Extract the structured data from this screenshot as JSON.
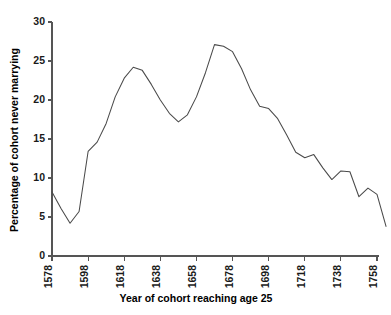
{
  "chart_data": {
    "type": "line",
    "title": "",
    "subtitle": "",
    "xlabel": "Year of cohort reaching age 25",
    "ylabel": "Percentage of cohort never marrying",
    "xlim": [
      1578,
      1758
    ],
    "ylim": [
      0,
      30
    ],
    "grid": false,
    "legend": null,
    "legend_position": "none",
    "xticks": [
      1578,
      1598,
      1618,
      1638,
      1658,
      1678,
      1698,
      1718,
      1738,
      1758
    ],
    "xtick_labels": [
      "1578",
      "1598",
      "1618",
      "1638",
      "1658",
      "1678",
      "1698",
      "1718",
      "1738",
      "1758"
    ],
    "xtick_rotation": 90,
    "yticks": [
      0,
      5,
      10,
      15,
      20,
      25,
      30
    ],
    "ytick_labels": [
      "0",
      "5",
      "10",
      "15",
      "20",
      "25",
      "30"
    ],
    "line_color": "#4a4a4a",
    "axis_color": "#555555",
    "x": [
      1578,
      1583,
      1588,
      1593,
      1598,
      1603,
      1608,
      1613,
      1618,
      1623,
      1628,
      1633,
      1638,
      1643,
      1648,
      1653,
      1658,
      1663,
      1668,
      1673,
      1678,
      1683,
      1688,
      1693,
      1698,
      1703,
      1708,
      1713,
      1718,
      1723,
      1728,
      1733,
      1738,
      1743,
      1748,
      1753,
      1758
    ],
    "values": [
      8.2,
      6.1,
      4.2,
      5.7,
      13.4,
      14.6,
      17.0,
      20.4,
      22.8,
      24.2,
      23.8,
      22.0,
      20.0,
      18.3,
      17.2,
      18.1,
      20.4,
      23.5,
      27.1,
      26.9,
      26.2,
      24.0,
      21.3,
      19.2,
      18.9,
      17.6,
      15.5,
      13.3,
      12.6,
      13.0,
      11.3,
      9.8,
      10.9,
      10.8,
      7.6,
      8.7,
      7.9
    ],
    "annotations": [
      {
        "label": "first peak",
        "x": 1623,
        "y": 24.2
      },
      {
        "label": "mid trough",
        "x": 1648,
        "y": 17.2
      },
      {
        "label": "maximum",
        "x": 1668,
        "y": 27.1
      },
      {
        "label": "early minimum",
        "x": 1588,
        "y": 4.2
      }
    ],
    "tail": {
      "x": [
        1758,
        1763
      ],
      "values": [
        7.9,
        3.8
      ]
    }
  }
}
